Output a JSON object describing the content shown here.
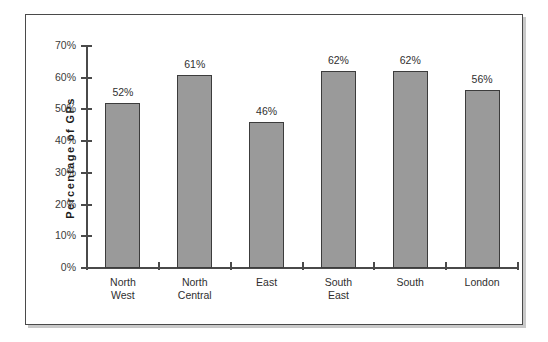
{
  "chart_data": {
    "type": "bar",
    "title": "",
    "xlabel": "",
    "ylabel": "Percentage  of  GPs",
    "categories": [
      "North West",
      "North Central",
      "East",
      "South East",
      "South",
      "London"
    ],
    "category_lines": [
      [
        "North",
        "West"
      ],
      [
        "North",
        "Central"
      ],
      [
        "East"
      ],
      [
        "South",
        "East"
      ],
      [
        "South"
      ],
      [
        "London"
      ]
    ],
    "values": [
      52,
      61,
      46,
      62,
      62,
      56
    ],
    "value_labels": [
      "52%",
      "61%",
      "46%",
      "62%",
      "62%",
      "56%"
    ],
    "ylim": [
      0,
      70
    ],
    "ytick_values": [
      0,
      10,
      20,
      30,
      40,
      50,
      60,
      70
    ],
    "ytick_labels": [
      "0%",
      "10%",
      "20%",
      "30%",
      "40%",
      "50%",
      "60%",
      "70%"
    ],
    "grid": false,
    "legend": false,
    "bar_color": "#9a9a9a",
    "bar_border_color": "#3c3c3c",
    "axis_color": "#4a4a4a",
    "frame_color": "#4a4a4a",
    "background": "#ffffff"
  }
}
